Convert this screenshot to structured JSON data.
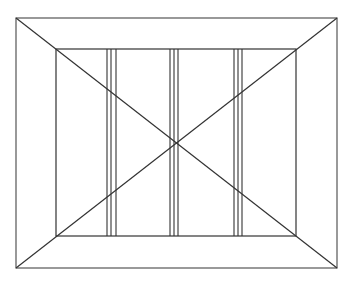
{
  "diagram": {
    "type": "line-drawing",
    "stroke_color": "#333333",
    "outer_frame": {
      "x1": 16,
      "y1": 18,
      "x2": 337,
      "y2": 268
    },
    "inner_frame": {
      "x1": 56,
      "y1": 49,
      "x2": 296,
      "y2": 236
    },
    "vertical_line_groups": [
      {
        "xs": [
          107,
          111,
          116
        ]
      },
      {
        "xs": [
          170,
          174,
          178
        ]
      },
      {
        "xs": [
          234,
          238,
          242
        ]
      }
    ],
    "diagonals": [
      {
        "from": "outer-top-left",
        "to": "outer-bottom-right"
      },
      {
        "from": "outer-top-right",
        "to": "outer-bottom-left"
      }
    ],
    "center": {
      "x": 175,
      "y": 142
    }
  }
}
